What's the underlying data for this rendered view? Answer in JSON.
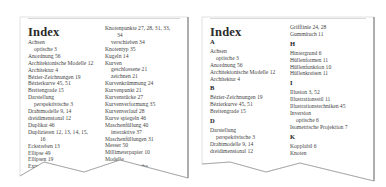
{
  "left_page": {
    "title": "Index",
    "col1": [
      {
        "text": "Achsen",
        "lvl": 0
      },
      {
        "text": "optische  3",
        "lvl": 1
      },
      {
        "text": "Anordnung  56",
        "lvl": 0
      },
      {
        "text": "Architektonische Modelle  12",
        "lvl": 0
      },
      {
        "text": "Architektur  4",
        "lvl": 0
      },
      {
        "text": "Bézier-Zeichnungen  19",
        "lvl": 0
      },
      {
        "text": "Bézierkurve  45, 51",
        "lvl": 0
      },
      {
        "text": "Breitengrade  15",
        "lvl": 0
      },
      {
        "text": "Darstellung",
        "lvl": 0
      },
      {
        "text": "perspektivische  3",
        "lvl": 1
      },
      {
        "text": "Drahtmodelle  9, 14",
        "lvl": 0
      },
      {
        "text": "dreidimensional  12",
        "lvl": 0
      },
      {
        "text": "Duplikat  46",
        "lvl": 0
      },
      {
        "text": "Duplizieren  12, 13, 14, 15,",
        "lvl": 0
      },
      {
        "text": "16",
        "lvl": 2
      },
      {
        "text": "Eckstreben  13",
        "lvl": 0
      },
      {
        "text": "Ellipse  49",
        "lvl": 0
      },
      {
        "text": "Ellipsen  19",
        "lvl": 0
      },
      {
        "text": "Extrusion  4",
        "lvl": 0
      },
      {
        "text": "Farbverlauf",
        "lvl": 0
      }
    ],
    "col2": [
      {
        "text": "Knotenpunkte  27, 28, 31, 33,",
        "lvl": 0
      },
      {
        "text": "34",
        "lvl": 2
      },
      {
        "text": "verschieben  34",
        "lvl": 1
      },
      {
        "text": "Knotentyp  35",
        "lvl": 0
      },
      {
        "text": "Kugeln  14",
        "lvl": 0
      },
      {
        "text": "Kurven",
        "lvl": 0
      },
      {
        "text": "geschlossene  21",
        "lvl": 1
      },
      {
        "text": "zeichnen  21",
        "lvl": 1
      },
      {
        "text": "Kurvenkrümmung  24",
        "lvl": 0
      },
      {
        "text": "Kurvenpunkt  21",
        "lvl": 0
      },
      {
        "text": "Kurvenstücke  27",
        "lvl": 0
      },
      {
        "text": "Kurvenverformung  35",
        "lvl": 0
      },
      {
        "text": "Kurvenverlauf  28",
        "lvl": 0
      },
      {
        "text": "Kurve spiegeln  46",
        "lvl": 0
      },
      {
        "text": "Maschenfüllung  40",
        "lvl": 0
      },
      {
        "text": "interaktive  37",
        "lvl": 1
      },
      {
        "text": "Maschenfüllungen  31",
        "lvl": 0
      },
      {
        "text": "Messer  50",
        "lvl": 0
      },
      {
        "text": "Millimeterpapier  10",
        "lvl": 0
      },
      {
        "text": "Modelle",
        "lvl": 0
      },
      {
        "text": "architektonische",
        "lvl": 1
      }
    ]
  },
  "right_page": {
    "title": "Index",
    "col1": [
      {
        "letter": "A"
      },
      {
        "text": "Achsen",
        "lvl": 0
      },
      {
        "text": "optische  3",
        "lvl": 1
      },
      {
        "text": "Anordnung  56",
        "lvl": 0
      },
      {
        "text": "Architektonische Modelle  12",
        "lvl": 0
      },
      {
        "text": "Architektur  4",
        "lvl": 0
      },
      {
        "letter": "B"
      },
      {
        "text": "Bézier-Zeichnungen  19",
        "lvl": 0
      },
      {
        "text": "Bézierkurve  45, 51",
        "lvl": 0
      },
      {
        "text": "Breitengrade  15",
        "lvl": 0
      },
      {
        "letter": "D"
      },
      {
        "text": "Darstellung",
        "lvl": 0
      },
      {
        "text": "perspektivische  3",
        "lvl": 1
      },
      {
        "text": "Drahtmodelle  9, 14",
        "lvl": 0
      },
      {
        "text": "dreidimensional  12",
        "lvl": 0
      }
    ],
    "col2": [
      {
        "text": "Grifflinie  24, 28",
        "lvl": 0
      },
      {
        "text": "Gummituch  11",
        "lvl": 0
      },
      {
        "letter": "H"
      },
      {
        "text": "Hintergrund  6",
        "lvl": 0
      },
      {
        "text": "Hüllenformen  11",
        "lvl": 0
      },
      {
        "text": "Hüllenfunktion  10",
        "lvl": 0
      },
      {
        "text": "Hüllenkreisen  11",
        "lvl": 0
      },
      {
        "letter": "I"
      },
      {
        "text": "Illusion  3, 52",
        "lvl": 0
      },
      {
        "text": "Illustrationsstil  11",
        "lvl": 0
      },
      {
        "text": "Illustrationstechniken  45",
        "lvl": 0
      },
      {
        "text": "Inversion",
        "lvl": 0
      },
      {
        "text": "optische  6",
        "lvl": 1
      },
      {
        "text": "Isometrische Projektion  7",
        "lvl": 0
      },
      {
        "letter": "K"
      },
      {
        "text": "Kopplabil  6",
        "lvl": 0
      },
      {
        "text": "Knoten",
        "lvl": 0
      }
    ]
  }
}
